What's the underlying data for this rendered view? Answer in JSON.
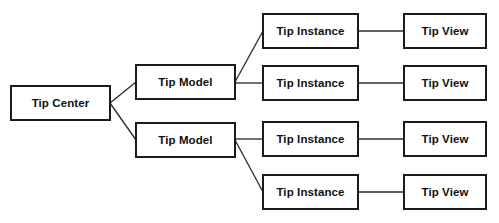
{
  "diagram": {
    "type": "block-diagram",
    "canvas": {
      "width": 499,
      "height": 223,
      "background": "#ffffff"
    },
    "style": {
      "box_stroke": "#1b1b1b",
      "box_fill": "#ffffff",
      "edge_stroke": "#2e2e2e",
      "label_color": "#111111"
    },
    "nodes": [
      {
        "id": "tip-center",
        "label": "Tip Center",
        "x": 11,
        "y": 86,
        "w": 99,
        "h": 34,
        "level": 0
      },
      {
        "id": "tip-model-1",
        "label": "Tip Model",
        "x": 136,
        "y": 65,
        "w": 99,
        "h": 34,
        "level": 1
      },
      {
        "id": "tip-model-2",
        "label": "Tip Model",
        "x": 136,
        "y": 123,
        "w": 99,
        "h": 34,
        "level": 1
      },
      {
        "id": "tip-instance-1",
        "label": "Tip Instance",
        "x": 263,
        "y": 14,
        "w": 95,
        "h": 34,
        "level": 2
      },
      {
        "id": "tip-instance-2",
        "label": "Tip Instance",
        "x": 263,
        "y": 66,
        "w": 95,
        "h": 34,
        "level": 2
      },
      {
        "id": "tip-instance-3",
        "label": "Tip Instance",
        "x": 263,
        "y": 122,
        "w": 95,
        "h": 34,
        "level": 2
      },
      {
        "id": "tip-instance-4",
        "label": "Tip Instance",
        "x": 263,
        "y": 175,
        "w": 95,
        "h": 34,
        "level": 2
      },
      {
        "id": "tip-view-1",
        "label": "Tip View",
        "x": 404,
        "y": 14,
        "w": 82,
        "h": 34,
        "level": 3
      },
      {
        "id": "tip-view-2",
        "label": "Tip View",
        "x": 404,
        "y": 66,
        "w": 82,
        "h": 34,
        "level": 3
      },
      {
        "id": "tip-view-3",
        "label": "Tip View",
        "x": 404,
        "y": 122,
        "w": 82,
        "h": 34,
        "level": 3
      },
      {
        "id": "tip-view-4",
        "label": "Tip View",
        "x": 404,
        "y": 175,
        "w": 82,
        "h": 34,
        "level": 3
      }
    ],
    "edges": [
      {
        "id": "edge-center-model1",
        "from": "tip-center",
        "to": "tip-model-1",
        "x1": 110,
        "y1": 103,
        "x2": 136,
        "y2": 82
      },
      {
        "id": "edge-center-model2",
        "from": "tip-center",
        "to": "tip-model-2",
        "x1": 110,
        "y1": 103,
        "x2": 136,
        "y2": 140
      },
      {
        "id": "edge-model1-instance1",
        "from": "tip-model-1",
        "to": "tip-instance-1",
        "x1": 235,
        "y1": 82,
        "x2": 263,
        "y2": 31
      },
      {
        "id": "edge-model1-instance2",
        "from": "tip-model-1",
        "to": "tip-instance-2",
        "x1": 235,
        "y1": 83,
        "x2": 263,
        "y2": 83
      },
      {
        "id": "edge-model2-instance3",
        "from": "tip-model-2",
        "to": "tip-instance-3",
        "x1": 235,
        "y1": 139,
        "x2": 263,
        "y2": 139
      },
      {
        "id": "edge-model2-instance4",
        "from": "tip-model-2",
        "to": "tip-instance-4",
        "x1": 235,
        "y1": 140,
        "x2": 263,
        "y2": 192
      },
      {
        "id": "edge-instance1-view1",
        "from": "tip-instance-1",
        "to": "tip-view-1",
        "x1": 358,
        "y1": 31,
        "x2": 404,
        "y2": 31
      },
      {
        "id": "edge-instance2-view2",
        "from": "tip-instance-2",
        "to": "tip-view-2",
        "x1": 358,
        "y1": 83,
        "x2": 404,
        "y2": 83
      },
      {
        "id": "edge-instance3-view3",
        "from": "tip-instance-3",
        "to": "tip-view-3",
        "x1": 358,
        "y1": 139,
        "x2": 404,
        "y2": 139
      },
      {
        "id": "edge-instance4-view4",
        "from": "tip-instance-4",
        "to": "tip-view-4",
        "x1": 358,
        "y1": 192,
        "x2": 404,
        "y2": 192
      }
    ]
  }
}
